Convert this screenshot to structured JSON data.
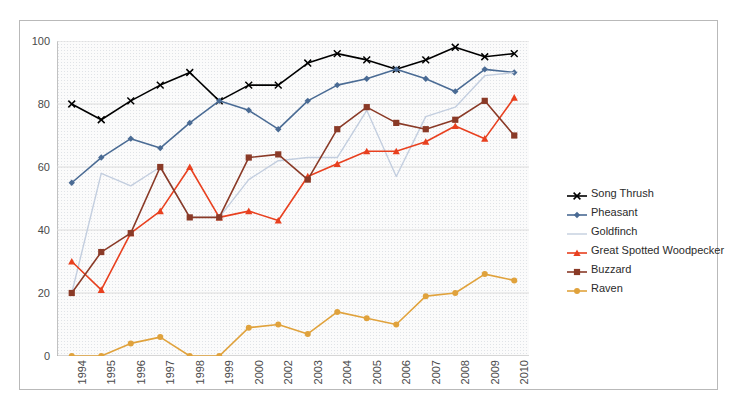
{
  "chart_data": {
    "type": "line",
    "title": "",
    "xlabel": "",
    "ylabel": "",
    "ylim": [
      0,
      100
    ],
    "yticks": [
      0,
      20,
      40,
      60,
      80,
      100
    ],
    "grid": true,
    "legend_position": "right",
    "categories": [
      "1994",
      "1995",
      "1996",
      "1997",
      "1998",
      "1999",
      "2000",
      "2002",
      "2003",
      "2004",
      "2005",
      "2006",
      "2007",
      "2008",
      "2009",
      "2010"
    ],
    "series": [
      {
        "name": "Song Thrush",
        "color": "#000000",
        "marker": "x",
        "values": [
          80,
          75,
          81,
          86,
          90,
          81,
          86,
          86,
          93,
          96,
          94,
          91,
          94,
          98,
          95,
          96
        ]
      },
      {
        "name": "Pheasant",
        "color": "#4a6b94",
        "marker": "diamond",
        "values": [
          55,
          63,
          69,
          66,
          74,
          81,
          78,
          72,
          81,
          86,
          88,
          91,
          88,
          84,
          91,
          90
        ]
      },
      {
        "name": "Goldfinch",
        "color": "#c3ceDF",
        "marker": "none",
        "values": [
          20,
          58,
          54,
          60,
          44,
          44,
          56,
          62,
          63,
          63,
          78,
          57,
          76,
          79,
          89,
          90
        ]
      },
      {
        "name": "Great Spotted Woodpecker",
        "color": "#e8401f",
        "marker": "triangle",
        "values": [
          30,
          21,
          39,
          46,
          60,
          44,
          46,
          43,
          57,
          61,
          65,
          65,
          68,
          73,
          69,
          82
        ]
      },
      {
        "name": "Buzzard",
        "color": "#8a3a27",
        "marker": "square",
        "values": [
          20,
          33,
          39,
          60,
          44,
          44,
          63,
          64,
          56,
          72,
          79,
          74,
          72,
          75,
          81,
          70
        ]
      },
      {
        "name": "Raven",
        "color": "#e0a23c",
        "marker": "circle",
        "values": [
          0,
          0,
          4,
          6,
          0,
          0,
          9,
          10,
          7,
          14,
          12,
          10,
          19,
          20,
          26,
          24
        ]
      }
    ]
  }
}
